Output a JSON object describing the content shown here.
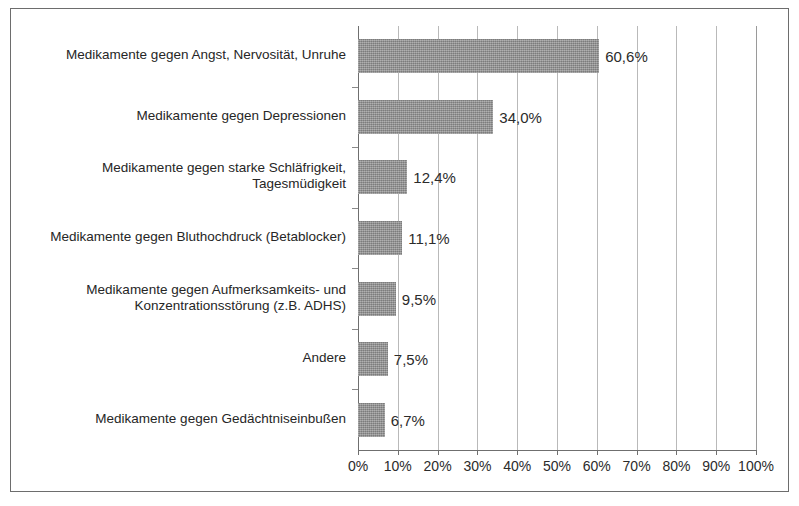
{
  "chart_data": {
    "type": "bar",
    "orientation": "horizontal",
    "title": "",
    "subtitle": "",
    "xlabel": "",
    "ylabel": "",
    "xlim": [
      0,
      100
    ],
    "grid": true,
    "legend": false,
    "legend_position": "none",
    "unit": "%",
    "decimal_separator": ",",
    "bar_color": "#969696",
    "categories": [
      "Medikamente gegen Angst, Nervosität,  Unruhe",
      "Medikamente gegen Depressionen",
      "Medikamente gegen starke Schläfrigkeit,\nTagesmüdigkeit",
      "Medikamente gegen Bluthochdruck (Betablocker)",
      "Medikamente gegen Aufmerksamkeits- und\nKonzentrationsstörung (z.B. ADHS)",
      "Andere",
      "Medikamente gegen Gedächtniseinbußen"
    ],
    "values": [
      60.6,
      34.0,
      12.4,
      11.1,
      9.5,
      7.5,
      6.7
    ],
    "value_labels": [
      "60,6%",
      "34,0%",
      "12,4%",
      "11,1%",
      "9,5%",
      "7,5%",
      "6,7%"
    ],
    "x_ticks": [
      0,
      10,
      20,
      30,
      40,
      50,
      60,
      70,
      80,
      90,
      100
    ],
    "x_tick_labels": [
      "0%",
      "10%",
      "20%",
      "30%",
      "40%",
      "50%",
      "60%",
      "70%",
      "80%",
      "90%",
      "100%"
    ]
  }
}
